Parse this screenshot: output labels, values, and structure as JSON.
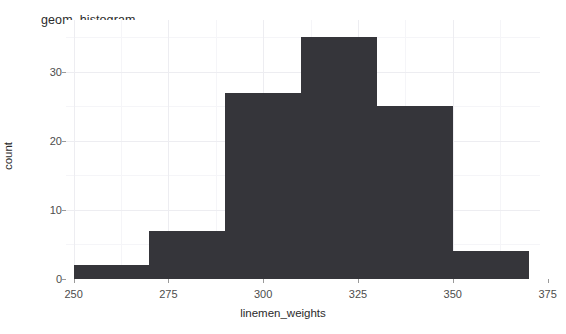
{
  "chart_data": {
    "type": "bar",
    "title": "geom_histogram",
    "xlabel": "linemen_weights",
    "ylabel": "count",
    "xlim": [
      248,
      373
    ],
    "ylim": [
      0,
      37.5
    ],
    "xticks": [
      250,
      275,
      300,
      325,
      350,
      375
    ],
    "yticks": [
      0,
      10,
      20,
      30
    ],
    "grid": true,
    "legend": null,
    "bin_width": 20,
    "bin_edges": [
      250,
      270,
      290,
      310,
      330,
      350,
      370
    ],
    "categories": [
      "250-270",
      "270-290",
      "290-310",
      "310-330",
      "330-350",
      "350-370"
    ],
    "values": [
      2,
      7,
      27,
      35,
      25,
      4
    ],
    "bar_color": "#35353a",
    "bars": [
      {
        "x0": 250,
        "x1": 270,
        "count": 2
      },
      {
        "x0": 270,
        "x1": 290,
        "count": 7
      },
      {
        "x0": 290,
        "x1": 310,
        "count": 27
      },
      {
        "x0": 310,
        "x1": 330,
        "count": 35
      },
      {
        "x0": 330,
        "x1": 350,
        "count": 25
      },
      {
        "x0": 350,
        "x1": 370,
        "count": 4
      }
    ]
  },
  "chart": {
    "title": "geom_histogram",
    "x_axis_title": "linemen_weights",
    "y_axis_title": "count",
    "x_tick_labels": [
      "250",
      "275",
      "300",
      "325",
      "350",
      "375"
    ],
    "y_tick_labels": [
      "0",
      "10",
      "20",
      "30"
    ],
    "colors": {
      "bar": "#35353a",
      "grid_major": "#ededf1",
      "grid_minor": "#f5f5f8",
      "text": "#4d4d4d",
      "background": "#ffffff"
    }
  }
}
